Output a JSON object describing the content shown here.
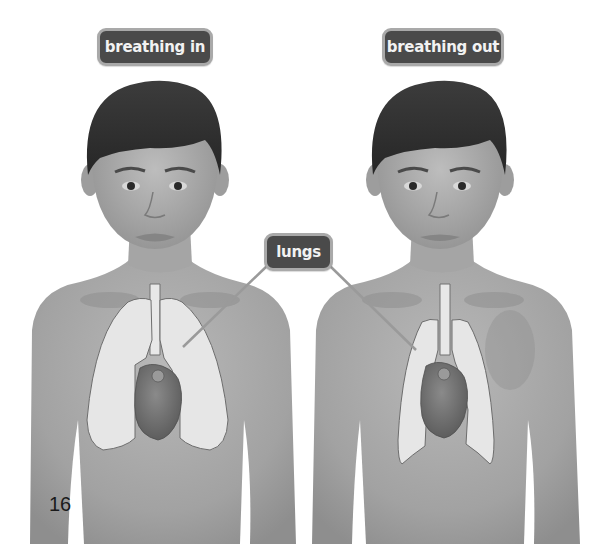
{
  "page": {
    "page_number": "16",
    "background_color": "#ffffff"
  },
  "labels": {
    "left_title": "breathing in",
    "right_title": "breathing out",
    "organ": "lungs"
  },
  "figures": [
    {
      "id": "boy-breathing-in",
      "state": "breathing in",
      "organs_shown": [
        "windpipe",
        "lungs (expanded)",
        "heart"
      ]
    },
    {
      "id": "boy-breathing-out",
      "state": "breathing out",
      "organs_shown": [
        "windpipe",
        "lungs (contracted)",
        "heart"
      ]
    }
  ],
  "colors": {
    "label_fill": "#4a4a4a",
    "label_border": "#a9a9a9",
    "label_text": "#f2f2f2",
    "skin": "#a8a8a8",
    "lung_fill": "#e6e6e6",
    "heart_fill": "#6e6e6e",
    "hair": "#2e2e2e",
    "leader_line": "#9a9a9a"
  }
}
